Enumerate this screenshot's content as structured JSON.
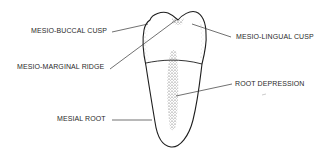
{
  "diagram": {
    "labels": {
      "mesio_buccal_cusp": "MESIO-BUCCAL CUSP",
      "mesio_marginal_ridge": "MESIO-MARGINAL RIDGE",
      "mesio_lingual_cusp": "MESIO-LINGUAL CUSP",
      "root_depression": "ROOT DEPRESSION",
      "mesial_root": "MESIAL ROOT"
    },
    "colors": {
      "ink": "#222222",
      "background": "#ffffff"
    }
  }
}
